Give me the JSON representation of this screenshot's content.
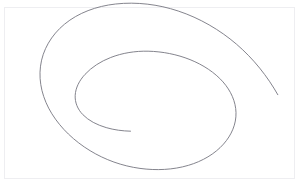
{
  "canvas": {
    "width": 305,
    "height": 186,
    "background_color": "#ffffff",
    "label": "spiral-drawing-canvas"
  },
  "frame": {
    "visible": true,
    "color": "#eeeef1",
    "x": 4,
    "y": 7,
    "width": 291,
    "height": 172
  },
  "drawing": {
    "type": "spiral",
    "title": "Elliptical spiral line drawing",
    "stroke_color": "#767680",
    "stroke_width": 0.9,
    "turns": 1.75,
    "winding": "counter-clockwise-outward",
    "center_x": 132,
    "center_y": 100,
    "inner_endpoint_x": 130,
    "inner_endpoint_y": 131,
    "outer_endpoint_x": 296,
    "outer_endpoint_y": 73,
    "path": "M130.5,131.2 C122.5,131.0 114.0,129.9 106.2,127.6 C97.0,124.9 88.7,120.7 82.8,114.6 C77.6,109.2 74.8,102.4 75.2,95.3 C75.6,87.8 79.3,80.6 85.0,74.4 C91.6,67.2 100.6,61.4 110.7,57.5 C122.3,53.0 135.2,50.9 148.1,51.2 C162.6,51.5 177.0,54.4 190.0,59.6 C203.2,64.9 214.7,72.5 223.0,81.9 C230.9,90.9 235.7,101.5 236.0,112.6 C236.3,124.0 231.6,135.0 223.5,144.1 C214.8,153.9 202.4,161.2 188.5,165.3 C173.0,169.9 156.2,170.6 140.0,168.4 C122.2,166.0 105.0,159.8 90.1,150.7 C74.2,141.0 60.9,128.3 51.9,113.8 C42.7,99.0 38.4,82.3 40.5,66.2 C42.6,49.9 51.3,35.1 64.5,24.2 C78.3,12.8 96.5,6.1 115.6,4.0 C136.5,1.7 158.1,4.3 178.2,11.0 C199.8,18.2 219.7,29.8 236.5,44.2 C253.6,58.9 267.4,76.3 277.8,94.7",
    "canvas_ink_note": "single continuous hand-drawn gray stroke"
  },
  "accessibility": {
    "alt_text": "A thin gray spiral curve drawn on a white rectangular canvas"
  }
}
